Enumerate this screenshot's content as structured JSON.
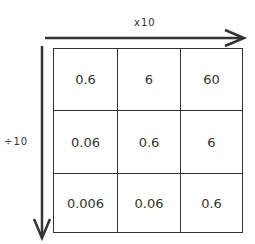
{
  "diagram": {
    "horizontal_arrow": {
      "label": "x10",
      "direction": "right"
    },
    "vertical_arrow": {
      "label": "÷10",
      "direction": "down"
    },
    "grid": {
      "rows": [
        [
          "0.6",
          "6",
          "60"
        ],
        [
          "0.06",
          "0.6",
          "6"
        ],
        [
          "0.006",
          "0.06",
          "0.6"
        ]
      ]
    },
    "colors": {
      "line": "#333333",
      "text": "#333333",
      "background": "#ffffff"
    }
  }
}
